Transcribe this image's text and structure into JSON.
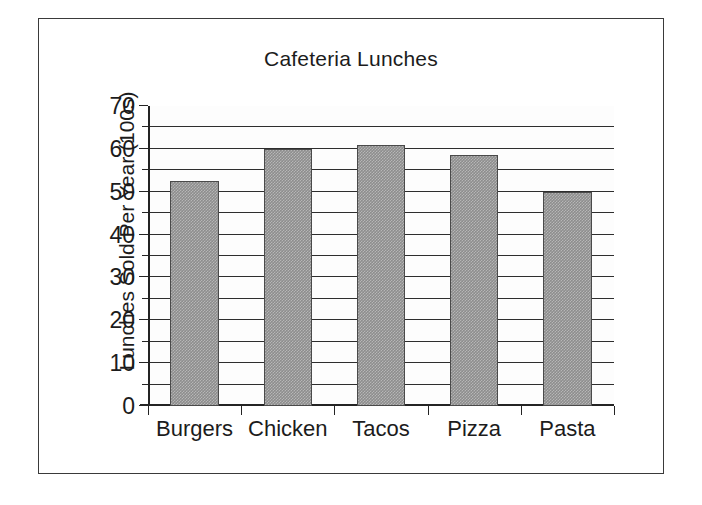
{
  "chart_data": {
    "type": "bar",
    "title": "Cafeteria Lunches",
    "xlabel": "",
    "ylabel": "Lunches Sold Per Year (100s)",
    "categories": [
      "Burgers",
      "Chicken",
      "Tacos",
      "Pizza",
      "Pasta"
    ],
    "values": [
      52.5,
      60,
      61,
      58.5,
      50
    ],
    "ylim": [
      0,
      70
    ],
    "y_major_ticks": [
      0,
      10,
      20,
      30,
      40,
      50,
      60,
      70
    ],
    "y_minor_ticks": [
      5,
      15,
      25,
      35,
      45,
      55,
      65
    ],
    "y_tick_labels": [
      "0",
      "10",
      "20",
      "30",
      "40",
      "50",
      "60",
      "70"
    ],
    "gridlines": [
      5,
      10,
      15,
      20,
      25,
      30,
      35,
      40,
      45,
      50,
      55,
      60,
      65
    ],
    "grid": true,
    "legend": null,
    "bar_color": "#8d8d8d",
    "bar_edge_color": "#4a4a4a",
    "axis_color": "#242424",
    "background_color": "#ffffff",
    "frame_border_color": "#3a3a3a"
  }
}
